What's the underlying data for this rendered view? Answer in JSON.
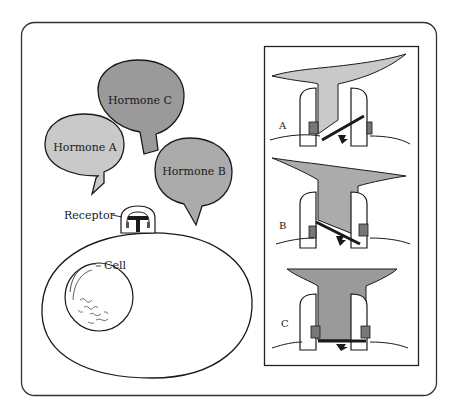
{
  "diagram": {
    "hormones": [
      {
        "id": "A",
        "label": "Hormone A",
        "color": "#c9c9c9"
      },
      {
        "id": "B",
        "label": "Hormone B",
        "color": "#ababab"
      },
      {
        "id": "C",
        "label": "Hormone C",
        "color": "#9a9a9a"
      }
    ],
    "receptor_label": "Receptor",
    "cell_label": "Cell",
    "panels": [
      {
        "label": "A",
        "color": "#c9c9c9"
      },
      {
        "label": "B",
        "color": "#ababab"
      },
      {
        "label": "C",
        "color": "#9a9a9a"
      }
    ],
    "colors": {
      "stroke": "#1a1a1a",
      "frame": "#333333",
      "background": "#ffffff"
    }
  }
}
